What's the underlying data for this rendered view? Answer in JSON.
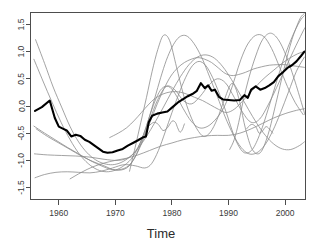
{
  "chart_data": {
    "type": "line",
    "title": "",
    "xlabel": "Time",
    "ylabel": "",
    "xlim": [
      1955.0,
      2003.6
    ],
    "ylim": [
      -1.72,
      1.72
    ],
    "grid": false,
    "legend": null,
    "x_ticks": [
      1960,
      1970,
      1980,
      1990,
      2000
    ],
    "x_tick_labels": [
      "1960",
      "1970",
      "1980",
      "1990",
      "2000"
    ],
    "y_ticks": [
      -1.5,
      -1.0,
      -0.5,
      0.0,
      0.5,
      1.0,
      1.5
    ],
    "y_tick_labels": [
      "-1.5",
      "-1.0",
      "-0.5",
      "0.0",
      "0.5",
      "1.0",
      "1.5"
    ],
    "series": [
      {
        "name": "mean-series",
        "emphasis": "thick",
        "color": "#000000",
        "x": [
          1955.8,
          1957.0,
          1958.4,
          1959.3,
          1960.0,
          1960.8,
          1961.4,
          1962.2,
          1963.0,
          1963.8,
          1964.6,
          1965.4,
          1966.2,
          1967.0,
          1967.8,
          1968.6,
          1969.5,
          1970.4,
          1971.3,
          1972.2,
          1973.1,
          1974.0,
          1974.8,
          1975.4,
          1975.9,
          1976.5,
          1977.4,
          1978.3,
          1979.2,
          1980.1,
          1981.0,
          1981.9,
          1982.8,
          1983.6,
          1984.4,
          1985.1,
          1985.8,
          1986.4,
          1987.0,
          1987.6,
          1988.3,
          1989.0,
          1990.0,
          1991.0,
          1992.0,
          1992.8,
          1993.4,
          1994.0,
          1994.8,
          1995.6,
          1996.4,
          1997.2,
          1998.0,
          1998.8,
          1999.6,
          2000.4,
          2001.2,
          2002.0,
          2002.8,
          2003.4
        ],
        "y": [
          -0.09,
          -0.02,
          0.1,
          -0.22,
          -0.38,
          -0.42,
          -0.45,
          -0.56,
          -0.53,
          -0.55,
          -0.62,
          -0.66,
          -0.72,
          -0.78,
          -0.84,
          -0.86,
          -0.85,
          -0.82,
          -0.79,
          -0.73,
          -0.68,
          -0.63,
          -0.58,
          -0.56,
          -0.3,
          -0.18,
          -0.14,
          -0.12,
          -0.1,
          -0.02,
          0.06,
          0.12,
          0.18,
          0.22,
          0.28,
          0.42,
          0.33,
          0.38,
          0.28,
          0.3,
          0.17,
          0.12,
          0.11,
          0.1,
          0.11,
          0.2,
          0.15,
          0.3,
          0.36,
          0.3,
          0.33,
          0.38,
          0.44,
          0.55,
          0.62,
          0.7,
          0.75,
          0.82,
          0.92,
          1.0
        ]
      },
      {
        "name": "curve-1",
        "emphasis": "thin",
        "color": "#8c8c8c",
        "x": [
          1955.9,
          1957.5,
          1959.0,
          1960.5,
          1962.0,
          1963.5,
          1965.0,
          1966.5,
          1968.0,
          1969.5,
          1971.0,
          1972.5,
          1974.0,
          1975.5,
          1977.0,
          1978.5,
          1980.0,
          1981.5,
          1983.0,
          1984.5,
          1986.0,
          1987.5,
          1989.0,
          1990.5,
          1992.0,
          1993.5,
          1995.0,
          1996.5,
          1998.0,
          1999.5,
          2001.0,
          2002.5,
          2003.4
        ],
        "y": [
          1.22,
          0.78,
          0.35,
          -0.02,
          -0.38,
          -0.66,
          -0.86,
          -0.99,
          -1.06,
          -1.08,
          -1.04,
          -0.94,
          -0.78,
          -0.56,
          -0.3,
          -0.02,
          0.27,
          0.54,
          0.76,
          0.9,
          0.94,
          0.88,
          0.72,
          0.49,
          0.22,
          -0.06,
          -0.32,
          -0.54,
          -0.7,
          -0.79,
          -0.8,
          -0.73,
          -0.66
        ]
      },
      {
        "name": "curve-2",
        "emphasis": "thin",
        "color": "#8c8c8c",
        "x": [
          1955.6,
          1957.2,
          1958.8,
          1960.4,
          1962.0,
          1963.6,
          1965.2,
          1966.8,
          1968.4,
          1970.0,
          1971.6,
          1973.2,
          1974.8,
          1976.0,
          1977.0,
          1978.0,
          1979.0,
          1980.0,
          1981.0,
          1982.0,
          1983.0,
          1984.2,
          1985.4,
          1986.6,
          1988.0,
          1989.4,
          1990.8,
          1992.2,
          1993.6,
          1995.0,
          1996.4,
          1997.8,
          1999.2,
          2000.6,
          2002.0,
          2003.4
        ],
        "y": [
          0.86,
          0.46,
          0.07,
          -0.3,
          -0.62,
          -0.88,
          -1.06,
          -1.17,
          -1.21,
          -1.18,
          -1.09,
          -0.92,
          -0.58,
          -0.2,
          0.16,
          0.52,
          0.84,
          1.08,
          1.24,
          1.3,
          1.26,
          1.1,
          0.86,
          0.55,
          0.18,
          -0.2,
          -0.52,
          -0.76,
          -0.88,
          -0.86,
          -0.72,
          -0.46,
          -0.12,
          0.26,
          0.64,
          0.9
        ]
      },
      {
        "name": "curve-3",
        "emphasis": "thin",
        "color": "#8c8c8c",
        "x": [
          1955.6,
          1957.5,
          1959.5,
          1961.5,
          1963.5,
          1965.5,
          1967.5,
          1969.5,
          1971.5,
          1973.0,
          1974.5,
          1976.0,
          1977.5,
          1979.0,
          1980.5,
          1982.0,
          1983.5,
          1985.0,
          1986.5,
          1988.0,
          1989.5,
          1991.0,
          1992.5,
          1994.0,
          1995.5,
          1997.0,
          1998.5,
          2000.0,
          2001.5,
          2003.0,
          2003.5
        ],
        "y": [
          -0.37,
          -0.5,
          -0.63,
          -0.76,
          -0.88,
          -1.0,
          -1.1,
          -1.17,
          -1.15,
          -1.02,
          -0.7,
          -0.28,
          0.12,
          0.36,
          0.3,
          0.1,
          0.04,
          0.18,
          0.38,
          0.5,
          0.42,
          0.16,
          -0.12,
          -0.3,
          -0.24,
          0.02,
          0.34,
          0.68,
          1.02,
          1.34,
          1.44
        ]
      },
      {
        "name": "curve-4",
        "emphasis": "thin",
        "color": "#8c8c8c",
        "x": [
          1955.7,
          1958.0,
          1960.5,
          1963.0,
          1965.5,
          1968.0,
          1970.5,
          1972.5,
          1974.0,
          1975.2,
          1976.2,
          1977.2,
          1978.2,
          1979.4,
          1980.6,
          1982.0,
          1983.4,
          1984.8,
          1986.2,
          1987.6,
          1989.0,
          1990.2,
          1991.2,
          1992.2,
          1993.4,
          1994.8,
          1996.2,
          1997.6,
          1999.0,
          2000.4,
          2001.8,
          2003.2
        ],
        "y": [
          -0.88,
          -0.9,
          -0.91,
          -0.92,
          -0.94,
          -0.98,
          -1.0,
          -0.94,
          -0.76,
          -0.46,
          -0.14,
          0.14,
          0.32,
          0.36,
          0.22,
          -0.05,
          -0.28,
          -0.4,
          -0.38,
          -0.26,
          -0.06,
          0.22,
          0.54,
          0.86,
          1.14,
          1.3,
          1.28,
          1.06,
          0.72,
          0.36,
          0.06,
          -0.16
        ]
      },
      {
        "name": "curve-5",
        "emphasis": "thin",
        "color": "#8c8c8c",
        "x": [
          1955.8,
          1957.5,
          1959.5,
          1961.5,
          1963.5,
          1965.5,
          1967.5,
          1969.5,
          1971.5,
          1973.5,
          1975.2,
          1976.4,
          1977.6,
          1978.8,
          1980.0,
          1981.2,
          1982.4,
          1983.6,
          1984.8,
          1986.0,
          1987.2,
          1988.4,
          1989.6,
          1990.6,
          1991.6,
          1992.8,
          1994.2,
          1995.6,
          1997.0,
          1998.4,
          1999.8,
          2001.2,
          2002.6,
          2003.4
        ],
        "y": [
          -1.32,
          -1.26,
          -1.22,
          -1.21,
          -1.22,
          -1.23,
          -1.2,
          -1.14,
          -1.08,
          -1.1,
          -1.14,
          -1.06,
          -0.82,
          -0.48,
          -0.12,
          0.22,
          0.52,
          0.74,
          0.82,
          0.74,
          0.52,
          0.22,
          -0.12,
          -0.44,
          -0.7,
          -0.86,
          -0.8,
          -0.5,
          -0.06,
          0.42,
          0.88,
          1.26,
          1.56,
          1.66
        ]
      },
      {
        "name": "curve-6",
        "emphasis": "thin",
        "color": "#8c8c8c",
        "x": [
          1956.0,
          1958.0,
          1960.0,
          1962.0,
          1964.0,
          1966.0,
          1968.0,
          1970.0,
          1972.0,
          1973.5,
          1975.0,
          1976.2,
          1977.4,
          1978.6,
          1979.8,
          1981.0,
          1982.2,
          1983.4,
          1984.6,
          1985.8,
          1987.0,
          1988.2,
          1989.4,
          1990.6,
          1991.8,
          1993.0,
          1994.4,
          1995.8,
          1997.2,
          1998.6,
          2000.0,
          2001.4,
          2002.8,
          2003.4
        ],
        "y": [
          -0.42,
          -0.56,
          -0.68,
          -0.8,
          -0.92,
          -1.02,
          -1.1,
          -1.18,
          -1.14,
          -0.94,
          -0.6,
          -0.28,
          0.04,
          0.32,
          0.55,
          0.7,
          0.8,
          0.86,
          0.89,
          0.86,
          0.8,
          0.7,
          0.6,
          0.56,
          0.58,
          0.62,
          0.68,
          0.72,
          0.75,
          0.76,
          0.76,
          0.74,
          0.72,
          0.71
        ]
      },
      {
        "name": "curve-7",
        "emphasis": "thin",
        "color": "#8c8c8c",
        "x": [
          1972.5,
          1973.5,
          1974.5,
          1975.5,
          1976.5,
          1977.5,
          1978.5,
          1979.6,
          1980.8,
          1982.0,
          1983.2,
          1984.4,
          1985.6,
          1986.8,
          1988.0,
          1989.2,
          1990.4,
          1991.2,
          1992.0,
          1993.0,
          1994.2,
          1995.6,
          1997.0,
          1998.4,
          1999.8,
          2001.2,
          2002.6,
          2003.4
        ],
        "y": [
          -1.2,
          -0.76,
          -0.3,
          0.16,
          0.64,
          1.04,
          1.3,
          1.2,
          0.72,
          0.22,
          -0.16,
          -0.42,
          -0.56,
          -0.48,
          -0.24,
          0.1,
          0.4,
          0.34,
          0.06,
          -0.42,
          -0.8,
          -0.86,
          -0.52,
          0.06,
          0.68,
          1.22,
          1.6,
          1.7
        ]
      },
      {
        "name": "curve-8",
        "emphasis": "thin",
        "color": "#8c8c8c",
        "x": [
          1969.0,
          1970.5,
          1972.0,
          1973.4,
          1974.6,
          1975.8,
          1977.0,
          1978.4,
          1979.8,
          1981.2,
          1982.6,
          1984.0,
          1985.4,
          1986.8,
          1988.2,
          1989.6,
          1991.0,
          1992.4,
          1993.8,
          1995.2,
          1996.6,
          1998.0,
          1999.4,
          2000.8,
          2002.2,
          2003.4
        ],
        "y": [
          -0.58,
          -0.5,
          -0.4,
          -0.26,
          -0.12,
          0.02,
          0.14,
          0.22,
          0.26,
          0.26,
          0.22,
          0.16,
          0.1,
          0.02,
          -0.06,
          -0.12,
          -0.06,
          0.08,
          0.24,
          0.4,
          0.54,
          0.66,
          0.78,
          0.88,
          0.96,
          1.0
        ]
      },
      {
        "name": "curve-9",
        "emphasis": "thin",
        "color": "#8c8c8c",
        "x": [
          1962.0,
          1964.0,
          1966.0,
          1968.0,
          1970.0,
          1972.0,
          1974.0,
          1976.0,
          1978.0,
          1980.0,
          1982.0,
          1984.0,
          1986.0,
          1988.0,
          1990.0,
          1992.0,
          1994.0,
          1996.0,
          1998.0,
          2000.0,
          2002.0,
          2003.4
        ],
        "y": [
          -1.34,
          -1.22,
          -1.12,
          -1.05,
          -1.0,
          -0.96,
          -0.9,
          -0.82,
          -0.74,
          -0.68,
          -0.62,
          -0.58,
          -0.55,
          -0.54,
          -0.54,
          -0.5,
          -0.42,
          -0.32,
          -0.22,
          -0.14,
          -0.08,
          -0.05
        ]
      },
      {
        "name": "curve-10",
        "emphasis": "thin",
        "color": "#8c8c8c",
        "x": [
          1990.2,
          1991.0,
          1991.8,
          1992.6,
          1993.6,
          1994.8,
          1996.0,
          1997.4,
          1998.8,
          2000.2,
          2001.6,
          2003.0,
          2003.5
        ],
        "y": [
          -0.8,
          -0.62,
          -0.3,
          0.1,
          0.52,
          0.92,
          1.22,
          1.34,
          1.22,
          0.92,
          0.5,
          0.02,
          -0.16
        ]
      },
      {
        "name": "curve-11",
        "emphasis": "thin",
        "color": "#8c8c8c",
        "x": [
          1976.0,
          1976.8,
          1977.6,
          1978.4,
          1979.2,
          1980.0,
          1980.6,
          1981.0,
          1981.4,
          1981.8,
          1982.2
        ],
        "y": [
          -0.36,
          -0.3,
          -0.34,
          -0.45,
          -0.4,
          -0.28,
          -0.3,
          -0.4,
          -0.48,
          -0.44,
          -0.33
        ]
      },
      {
        "name": "curve-12",
        "emphasis": "thin",
        "color": "#8c8c8c",
        "x": [
          1993.2,
          1994.0,
          1994.8,
          1995.4,
          1996.0,
          1996.6,
          1997.2,
          1997.8
        ],
        "y": [
          -0.42,
          -0.34,
          -0.38,
          -0.5,
          -0.46,
          -0.38,
          -0.42,
          -0.5
        ]
      }
    ]
  }
}
